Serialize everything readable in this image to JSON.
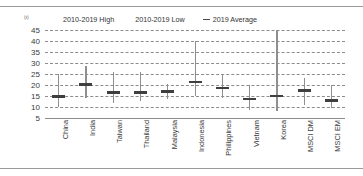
{
  "corner_label": "(x)",
  "legend": [
    {
      "label": "2010-2019 High",
      "marker": "none"
    },
    {
      "label": "2010-2019 Low",
      "marker": "none"
    },
    {
      "label": "2019 Average",
      "marker": "dash"
    }
  ],
  "colors": {
    "range_line": "#8f8f8f",
    "average_mark": "#3f3f3f",
    "gridline": "#8c8c8c",
    "rule": "#9a9a9a",
    "text": "#3a3a3a"
  },
  "chart_data": {
    "type": "bar",
    "title": "",
    "subtitle": "",
    "xlabel": "",
    "ylabel": "",
    "ylim": [
      5,
      45
    ],
    "yticks": [
      5,
      10,
      15,
      20,
      25,
      30,
      35,
      40,
      45
    ],
    "grid": true,
    "legend_position": "top",
    "categories": [
      "China",
      "India",
      "Taiwan",
      "Thailand",
      "Malaysia",
      "Indonesia",
      "Philippines",
      "Vietnam",
      "Korea",
      "MSCI DM",
      "MSCI EM"
    ],
    "series": [
      {
        "name": "2010-2019 High",
        "values": [
          25.0,
          28.5,
          25.8,
          25.8,
          20.5,
          40.0,
          25.0,
          20.0,
          45.0,
          23.0,
          20.0
        ]
      },
      {
        "name": "2010-2019 Low",
        "values": [
          10.0,
          14.0,
          12.0,
          12.5,
          13.5,
          15.0,
          14.0,
          8.5,
          8.0,
          11.0,
          9.5
        ]
      },
      {
        "name": "2019 Average",
        "values": [
          14.7,
          20.3,
          16.7,
          16.7,
          17.0,
          21.3,
          18.6,
          13.6,
          15.0,
          17.6,
          13.0
        ]
      }
    ]
  }
}
